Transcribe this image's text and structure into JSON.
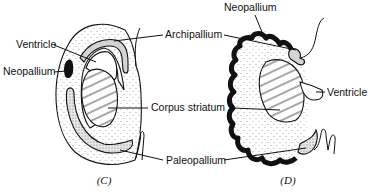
{
  "figure": {
    "panels": [
      {
        "id": "C",
        "caption": "(C)"
      },
      {
        "id": "D",
        "caption": "(D)"
      }
    ],
    "labels": {
      "ventricle_c": "Ventricle",
      "neopallium_c": "Neopallium",
      "archipallium": "Archipallium",
      "corpus_striatum": "Corpus striatum",
      "paleopallium": "Paleopallium",
      "neopallium_d": "Neopallium",
      "ventricle_d": "Ventricle"
    },
    "colors": {
      "ink": "#111111",
      "stipple": "#555555",
      "grey_band": "#d4d4d4",
      "background": "#ffffff"
    }
  }
}
